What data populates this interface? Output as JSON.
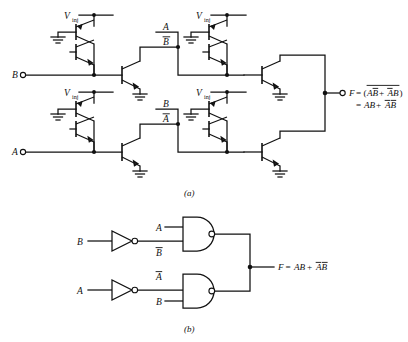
{
  "figure": {
    "captions": {
      "a": "(a)",
      "b": "(b)"
    }
  },
  "part_a": {
    "name": "i2l-transistor-schematic",
    "supply_labels": [
      {
        "id": "vinj-1",
        "text": "V",
        "sub": "inj"
      },
      {
        "id": "vinj-2",
        "text": "V",
        "sub": "inj"
      },
      {
        "id": "vinj-3",
        "text": "V",
        "sub": "inj"
      },
      {
        "id": "vinj-4",
        "text": "V",
        "sub": "inj"
      }
    ],
    "inputs": [
      {
        "id": "input-b",
        "label": "B"
      },
      {
        "id": "input-a",
        "label": "A"
      }
    ],
    "internal_nodes": [
      {
        "id": "node-a-upper",
        "label": "A",
        "bar": false
      },
      {
        "id": "node-bbar-upper",
        "label": "B",
        "bar": true
      },
      {
        "id": "node-b-lower",
        "label": "B",
        "bar": false
      },
      {
        "id": "node-abar-lower",
        "label": "A",
        "bar": true
      }
    ],
    "output": {
      "id": "output-f",
      "symbol": "F",
      "equals": "=",
      "line1_open": "(",
      "line1_term1": "AB",
      "line1_plus": "+",
      "line1_term2": "AB",
      "line1_close": ")",
      "line2_equals": "=",
      "line2_term1": "AB",
      "line2_plus": "+",
      "line2_term2": "AB"
    }
  },
  "part_b": {
    "name": "logic-gate-schematic",
    "inputs": [
      {
        "id": "inverter-input-b",
        "label": "B"
      },
      {
        "id": "inverter-input-a",
        "label": "A"
      }
    ],
    "gate_inputs": [
      {
        "id": "nand1-input-a",
        "label": "A",
        "bar": false
      },
      {
        "id": "nand1-input-bbar",
        "label": "B",
        "bar": true
      },
      {
        "id": "nand2-input-abar",
        "label": "A",
        "bar": true
      },
      {
        "id": "nand2-input-b",
        "label": "B",
        "bar": false
      }
    ],
    "gates": [
      {
        "id": "inverter-b",
        "type": "inverter"
      },
      {
        "id": "inverter-a",
        "type": "inverter"
      },
      {
        "id": "nand-gate-1",
        "type": "nand"
      },
      {
        "id": "nand-gate-2",
        "type": "nand"
      }
    ],
    "output": {
      "id": "output-f-logic",
      "symbol": "F",
      "equals": "=",
      "term1": "AB",
      "plus": "+",
      "term2": "AB"
    }
  },
  "colors": {
    "ink": "#111111",
    "background": "#ffffff"
  }
}
